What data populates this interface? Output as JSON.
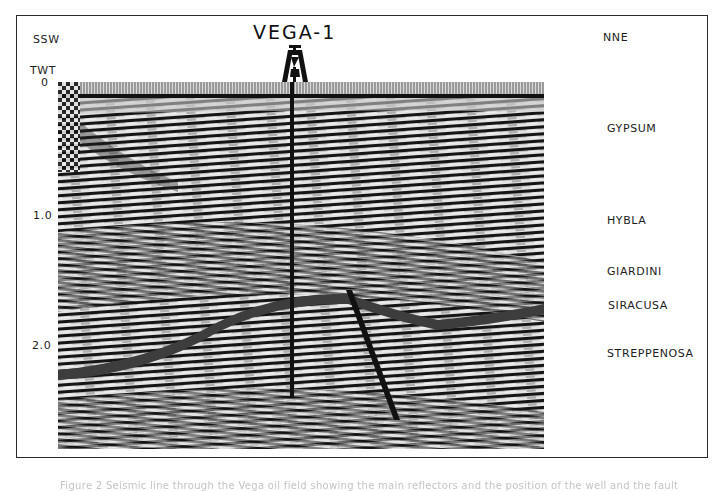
{
  "figure": {
    "well_name": "VEGA-1",
    "direction_left": "SSW",
    "direction_right": "NNE",
    "axis": {
      "title": "TWT",
      "ticks": [
        {
          "label": "0",
          "y": 82
        },
        {
          "label": "1.0",
          "y": 216
        },
        {
          "label": "2.0",
          "y": 346
        }
      ]
    },
    "horizons": [
      {
        "label": "GYPSUM",
        "y": 127
      },
      {
        "label": "HYBLA",
        "y": 219
      },
      {
        "label": "GIARDINI",
        "y": 270
      },
      {
        "label": "SIRACUSA",
        "y": 304
      },
      {
        "label": "STREPPENOSA",
        "y": 352
      }
    ],
    "caption": "Figure 2 Seismic line through the Vega oil field showing the main reflectors and the position of the well and the fault"
  },
  "colors": {
    "frame": "#2a2a2a",
    "text": "#1d1d1d",
    "seismic_dark": "#111111",
    "seismic_light": "#e8e8e8"
  }
}
